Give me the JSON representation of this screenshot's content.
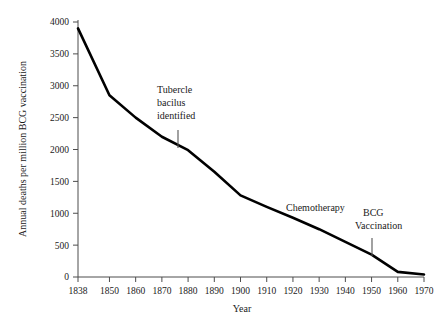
{
  "chart_data": {
    "type": "line",
    "title": "",
    "xlabel": "Year",
    "ylabel": "Annual deaths per million BCG vaccination",
    "x": [
      1838,
      1850,
      1860,
      1870,
      1880,
      1890,
      1900,
      1910,
      1920,
      1930,
      1940,
      1950,
      1960,
      1970
    ],
    "values": [
      3900,
      2850,
      2500,
      2200,
      1990,
      1650,
      1280,
      1100,
      930,
      750,
      550,
      350,
      80,
      40
    ],
    "xtick_labels": [
      "1838",
      "1850",
      "1860",
      "1870",
      "1880",
      "1890",
      "1900",
      "1910",
      "1920",
      "1930",
      "1940",
      "1950",
      "1960",
      "1970"
    ],
    "ytick_labels": [
      "0",
      "500",
      "1000",
      "1500",
      "2000",
      "2500",
      "3000",
      "3500",
      "4000"
    ],
    "ytick_values": [
      0,
      500,
      1000,
      1500,
      2000,
      2500,
      3000,
      3500,
      4000
    ],
    "xlim": [
      1838,
      1970
    ],
    "ylim": [
      0,
      4000
    ],
    "grid": false,
    "legend": "none",
    "line_color": "#000000",
    "axis_color": "#4d4d4d",
    "annotations": [
      {
        "id": "tubercle",
        "lines": [
          "Tubercle",
          "bacilus",
          "identified"
        ],
        "x": 1882,
        "y": 2000
      },
      {
        "id": "chemotherapy",
        "lines": [
          "Chemotherapy"
        ],
        "x": 1922,
        "y": 1000
      },
      {
        "id": "bcg",
        "lines": [
          "BCG",
          "Vaccination"
        ],
        "x": 1954,
        "y": 300
      }
    ]
  },
  "annotation_text": {
    "tubercle_line1": "Tubercle",
    "tubercle_line2": "bacilus",
    "tubercle_line3": "identified",
    "chemotherapy": "Chemotherapy",
    "bcg_line1": "BCG",
    "bcg_line2": "Vaccination"
  },
  "axis_titles": {
    "x": "Year",
    "y": "Annual deaths per million BCG vaccination"
  },
  "xticks": {
    "t0": "1838",
    "t1": "1850",
    "t2": "1860",
    "t3": "1870",
    "t4": "1880",
    "t5": "1890",
    "t6": "1900",
    "t7": "1910",
    "t8": "1920",
    "t9": "1930",
    "t10": "1940",
    "t11": "1950",
    "t12": "1960",
    "t13": "1970"
  },
  "yticks": {
    "t0": "0",
    "t1": "500",
    "t2": "1000",
    "t3": "1500",
    "t4": "2000",
    "t5": "2500",
    "t6": "3000",
    "t7": "3500",
    "t8": "4000"
  }
}
